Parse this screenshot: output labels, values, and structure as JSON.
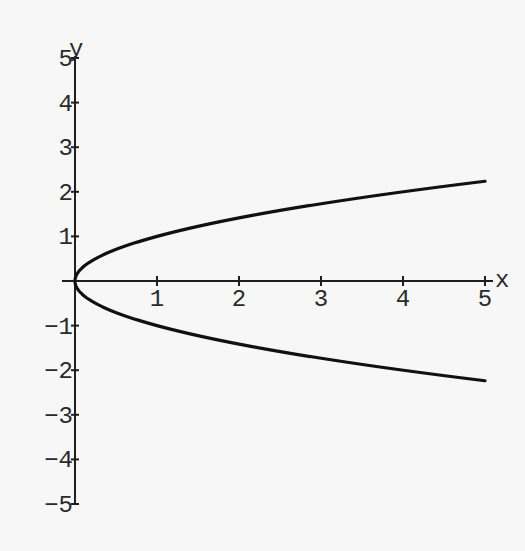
{
  "chart_data": {
    "type": "line",
    "title": "",
    "xlabel": "x",
    "ylabel": "y",
    "xlim": [
      0,
      5
    ],
    "ylim": [
      -5,
      5
    ],
    "grid": false,
    "legend": null,
    "x_ticks": [
      "1",
      "2",
      "3",
      "4",
      "5"
    ],
    "y_ticks": [
      "5",
      "4",
      "3",
      "2",
      "1",
      "-1",
      "-2",
      "-3",
      "-4",
      "-5"
    ],
    "series": [
      {
        "name": "upper branch (y = sqrt(x))",
        "x": [
          0,
          0.05,
          0.1,
          0.25,
          0.5,
          0.75,
          1,
          1.5,
          2,
          2.5,
          3,
          3.5,
          4,
          4.5,
          5
        ],
        "y": [
          0,
          0.224,
          0.316,
          0.5,
          0.707,
          0.866,
          1,
          1.225,
          1.414,
          1.581,
          1.732,
          1.871,
          2,
          2.121,
          2.236
        ]
      },
      {
        "name": "lower branch (y = -sqrt(x))",
        "x": [
          0,
          0.05,
          0.1,
          0.25,
          0.5,
          0.75,
          1,
          1.5,
          2,
          2.5,
          3,
          3.5,
          4,
          4.5,
          5
        ],
        "y": [
          0,
          -0.224,
          -0.316,
          -0.5,
          -0.707,
          -0.866,
          -1,
          -1.225,
          -1.414,
          -1.581,
          -1.732,
          -1.871,
          -2,
          -2.121,
          -2.236
        ]
      }
    ],
    "annotation": "curve x = y^2"
  },
  "axes": {
    "x_label": "x",
    "y_label": "y"
  }
}
